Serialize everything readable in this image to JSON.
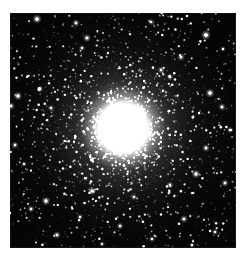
{
  "page": {
    "background_color": "#ffffff",
    "width": 244,
    "height": 260
  },
  "image_plate": {
    "name": "globular-cluster-photograph",
    "alt_text": "Globular star cluster",
    "background_color": "#050505",
    "left": 10,
    "top": 13,
    "width": 226,
    "height": 235
  },
  "chart_data": {
    "type": "scatter",
    "title": "",
    "xlabel": "",
    "ylabel": "",
    "grid": false,
    "legend": null,
    "xlim": [
      0,
      226
    ],
    "ylim": [
      0,
      235
    ],
    "background_color": "#050505",
    "star_color": "#ffffff",
    "cluster": {
      "center_x": 113,
      "center_y": 115,
      "core_radius": 17,
      "core_color": "#ffffff",
      "halo_radius": 78,
      "outer_radius": 150,
      "total_stars": 5200,
      "concentration": 2.3
    },
    "bright_field_stars": [
      {
        "x": 27,
        "y": 6,
        "r": 1.8,
        "b": 0.95
      },
      {
        "x": 66,
        "y": 10,
        "r": 1.5,
        "b": 0.8
      },
      {
        "x": 77,
        "y": 25,
        "r": 1.6,
        "b": 0.85
      },
      {
        "x": 72,
        "y": 35,
        "r": 1.3,
        "b": 0.7
      },
      {
        "x": 141,
        "y": 9,
        "r": 1.3,
        "b": 0.72
      },
      {
        "x": 196,
        "y": 22,
        "r": 1.9,
        "b": 0.97
      },
      {
        "x": 213,
        "y": 36,
        "r": 1.2,
        "b": 0.65
      },
      {
        "x": 171,
        "y": 44,
        "r": 1.5,
        "b": 0.8
      },
      {
        "x": 151,
        "y": 57,
        "r": 1.4,
        "b": 0.75
      },
      {
        "x": 160,
        "y": 64,
        "r": 1.3,
        "b": 0.7
      },
      {
        "x": 8,
        "y": 83,
        "r": 1.7,
        "b": 0.9
      },
      {
        "x": 1,
        "y": 93,
        "r": 1.5,
        "b": 0.82
      },
      {
        "x": 30,
        "y": 76,
        "r": 1.4,
        "b": 0.76
      },
      {
        "x": 41,
        "y": 95,
        "r": 1.3,
        "b": 0.7
      },
      {
        "x": 200,
        "y": 80,
        "r": 1.8,
        "b": 0.93
      },
      {
        "x": 212,
        "y": 94,
        "r": 1.5,
        "b": 0.8
      },
      {
        "x": 5,
        "y": 132,
        "r": 1.4,
        "b": 0.78
      },
      {
        "x": 14,
        "y": 151,
        "r": 1.2,
        "b": 0.62
      },
      {
        "x": 196,
        "y": 135,
        "r": 1.5,
        "b": 0.83
      },
      {
        "x": 220,
        "y": 117,
        "r": 1.3,
        "b": 0.7
      },
      {
        "x": 186,
        "y": 161,
        "r": 1.7,
        "b": 0.9
      },
      {
        "x": 215,
        "y": 170,
        "r": 1.5,
        "b": 0.8
      },
      {
        "x": 160,
        "y": 172,
        "r": 1.4,
        "b": 0.75
      },
      {
        "x": 124,
        "y": 184,
        "r": 1.3,
        "b": 0.7
      },
      {
        "x": 82,
        "y": 178,
        "r": 1.6,
        "b": 0.88
      },
      {
        "x": 36,
        "y": 188,
        "r": 1.7,
        "b": 0.9
      },
      {
        "x": 21,
        "y": 196,
        "r": 1.4,
        "b": 0.76
      },
      {
        "x": 70,
        "y": 204,
        "r": 1.3,
        "b": 0.68
      },
      {
        "x": 110,
        "y": 213,
        "r": 1.4,
        "b": 0.74
      },
      {
        "x": 174,
        "y": 206,
        "r": 1.5,
        "b": 0.82
      },
      {
        "x": 205,
        "y": 219,
        "r": 1.3,
        "b": 0.7
      },
      {
        "x": 47,
        "y": 222,
        "r": 1.5,
        "b": 0.8
      },
      {
        "x": 92,
        "y": 231,
        "r": 1.2,
        "b": 0.62
      },
      {
        "x": 142,
        "y": 226,
        "r": 1.3,
        "b": 0.68
      },
      {
        "x": 182,
        "y": 232,
        "r": 1.2,
        "b": 0.6
      }
    ]
  }
}
